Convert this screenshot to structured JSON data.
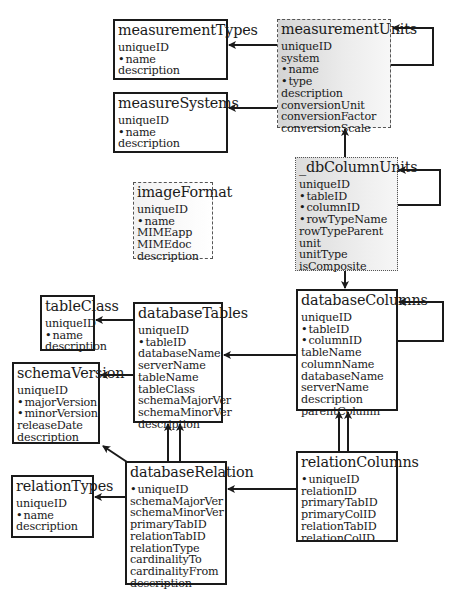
{
  "diagram": {
    "type": "entity-relationship schema",
    "entities": {
      "measurementTypes": {
        "title": "measurementTypes",
        "fields": [
          "uniqueID",
          "name",
          "description"
        ],
        "key_fields": [
          "name"
        ]
      },
      "measureSystems": {
        "title": "measureSystems",
        "fields": [
          "uniqueID",
          "name",
          "description"
        ],
        "key_fields": [
          "name"
        ]
      },
      "measurementUnits": {
        "title": "measurementUnits",
        "fields": [
          "uniqueID",
          "system",
          "name",
          "type",
          "description",
          "conversionUnit",
          "conversionFactor",
          "conversionScale"
        ],
        "key_fields": [
          "name",
          "type"
        ],
        "style": "dash-dot, shaded"
      },
      "imageFormat": {
        "title": "imageFormat",
        "fields": [
          "uniqueID",
          "name",
          "MIMEapp",
          "MIMEdoc",
          "description"
        ],
        "key_fields": [
          "name"
        ],
        "style": "dash-dot, shaded"
      },
      "dbColumnUnits": {
        "title": "_dbColumnUnits",
        "fields": [
          "uniqueID",
          "tableID",
          "columnID",
          "rowTypeName",
          "rowTypeParent",
          "unit",
          "unitType",
          "isComposite"
        ],
        "key_fields": [
          "tableID",
          "columnID",
          "rowTypeName"
        ],
        "style": "dotted, shaded"
      },
      "tableClass": {
        "title": "tableClass",
        "fields": [
          "uniqueID",
          "name",
          "description"
        ],
        "key_fields": [
          "name"
        ]
      },
      "databaseTables": {
        "title": "databaseTables",
        "fields": [
          "uniqueID",
          "tableID",
          "databaseName",
          "serverName",
          "tableName",
          "tableClass",
          "schemaMajorVer",
          "schemaMinorVer",
          "description"
        ],
        "key_fields": [
          "tableID"
        ]
      },
      "databaseColumns": {
        "title": "databaseColumns",
        "fields": [
          "uniqueID",
          "tableID",
          "columnID",
          "tableName",
          "columnName",
          "databaseName",
          "serverName",
          "description",
          "parentColumn"
        ],
        "key_fields": [
          "tableID",
          "columnID"
        ]
      },
      "schemaVersion": {
        "title": "schemaVersion",
        "fields": [
          "uniqueID",
          "majorVersion",
          "minorVersion",
          "releaseDate",
          "description"
        ],
        "key_fields": [
          "majorVersion",
          "minorVersion"
        ]
      },
      "relationTypes": {
        "title": "relationTypes",
        "fields": [
          "uniqueID",
          "name",
          "description"
        ],
        "key_fields": [
          "name"
        ]
      },
      "databaseRelation": {
        "title": "databaseRelation",
        "fields": [
          "uniqueID",
          "schemaMajorVer",
          "schemaMinorVer",
          "primaryTabID",
          "relationTabID",
          "relationType",
          "cardinalityTo",
          "cardinalityFrom",
          "description"
        ],
        "key_fields": [
          "uniqueID"
        ]
      },
      "relationColumns": {
        "title": "relationColumns",
        "fields": [
          "uniqueID",
          "relationID",
          "primaryTabID",
          "primaryColID",
          "relationTabID",
          "relationColID"
        ],
        "key_fields": [
          "uniqueID"
        ]
      }
    },
    "relationships": [
      {
        "from": "measurementUnits",
        "to": "measurementTypes"
      },
      {
        "from": "measurementUnits",
        "to": "measureSystems"
      },
      {
        "from": "measurementUnits",
        "to": "measurementUnits",
        "self": true
      },
      {
        "from": "dbColumnUnits",
        "to": "measurementUnits"
      },
      {
        "from": "dbColumnUnits",
        "to": "dbColumnUnits",
        "self": true
      },
      {
        "from": "dbColumnUnits",
        "to": "databaseColumns"
      },
      {
        "from": "databaseColumns",
        "to": "databaseColumns",
        "self": true
      },
      {
        "from": "databaseColumns",
        "to": "databaseTables"
      },
      {
        "from": "databaseTables",
        "to": "tableClass"
      },
      {
        "from": "databaseTables",
        "to": "schemaVersion"
      },
      {
        "from": "databaseRelation",
        "to": "databaseTables",
        "count": 2
      },
      {
        "from": "databaseRelation",
        "to": "schemaVersion"
      },
      {
        "from": "databaseRelation",
        "to": "relationTypes"
      },
      {
        "from": "relationColumns",
        "to": "databaseColumns",
        "count": 2
      },
      {
        "from": "relationColumns",
        "to": "databaseRelation"
      }
    ]
  }
}
